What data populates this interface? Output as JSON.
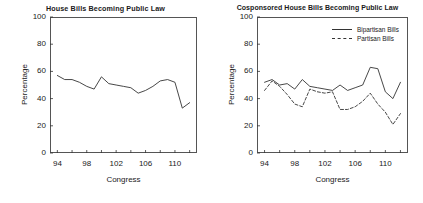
{
  "figure": {
    "width": 423,
    "height": 203,
    "background": "#ffffff",
    "line_color": "#333333"
  },
  "chart_data": [
    {
      "type": "line",
      "panel": "left",
      "title": "House Bills Becoming Public Law",
      "xlabel": "Congress",
      "ylabel": "Percentage",
      "xlim": [
        93,
        113
      ],
      "ylim": [
        0,
        100
      ],
      "grid": false,
      "legend": null,
      "xticks": [
        94,
        96,
        98,
        100,
        102,
        104,
        106,
        108,
        110,
        112
      ],
      "xtick_labels": [
        "94",
        "",
        "98",
        "",
        "102",
        "",
        "106",
        "",
        "110",
        ""
      ],
      "yticks": [
        0,
        20,
        40,
        60,
        80,
        100
      ],
      "ytick_labels": [
        "0",
        "20",
        "40",
        "60",
        "80",
        "100"
      ],
      "x": [
        94,
        95,
        96,
        97,
        98,
        99,
        100,
        101,
        102,
        103,
        104,
        105,
        106,
        107,
        108,
        109,
        110,
        111,
        112
      ],
      "series": [
        {
          "name": "House Bills Becoming Public Law",
          "style": "solid",
          "values": [
            57,
            54,
            54,
            52,
            49,
            47,
            56,
            51,
            50,
            49,
            48,
            44,
            46,
            49,
            53,
            54,
            52,
            33,
            37
          ]
        }
      ]
    },
    {
      "type": "line",
      "panel": "right",
      "title": "Cosponsored House Bills Becoming Public Law",
      "xlabel": "Congress",
      "ylabel": "Percentage",
      "xlim": [
        93,
        113
      ],
      "ylim": [
        0,
        100
      ],
      "grid": false,
      "legend": "upper right",
      "xticks": [
        94,
        96,
        98,
        100,
        102,
        104,
        106,
        108,
        110,
        112
      ],
      "xtick_labels": [
        "94",
        "",
        "98",
        "",
        "102",
        "",
        "106",
        "",
        "110",
        ""
      ],
      "yticks": [
        0,
        20,
        40,
        60,
        80,
        100
      ],
      "ytick_labels": [
        "0",
        "20",
        "40",
        "60",
        "80",
        "100"
      ],
      "x": [
        94,
        95,
        96,
        97,
        98,
        99,
        100,
        101,
        102,
        103,
        104,
        105,
        106,
        107,
        108,
        109,
        110,
        111,
        112
      ],
      "series": [
        {
          "name": "Bipartisan Bills",
          "style": "solid",
          "values": [
            52,
            54,
            50,
            51,
            47,
            54,
            49,
            48,
            47,
            46,
            50,
            46,
            48,
            50,
            63,
            62,
            45,
            40,
            52
          ]
        },
        {
          "name": "Partisan Bills",
          "style": "dashed",
          "values": [
            46,
            53,
            49,
            43,
            36,
            34,
            47,
            45,
            44,
            45,
            32,
            32,
            34,
            38,
            44,
            36,
            30,
            21,
            29
          ]
        }
      ]
    }
  ],
  "legend": {
    "items": [
      {
        "label": "Bipartisan Bills",
        "style": "solid"
      },
      {
        "label": "Partisan Bills",
        "style": "dashed"
      }
    ]
  }
}
